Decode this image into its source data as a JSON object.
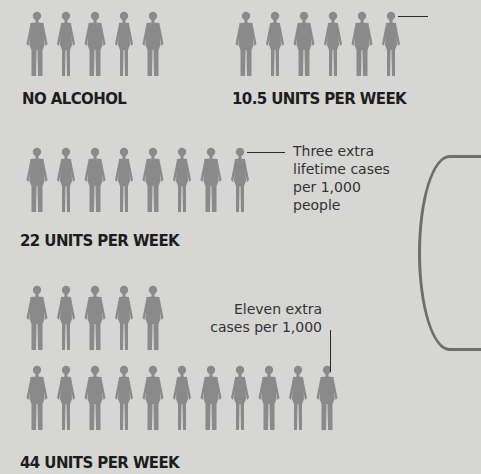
{
  "chart_data": {
    "type": "pictogram",
    "title": "",
    "unit": "people figures",
    "categories": [
      "NO ALCOHOL",
      "10.5 UNITS PER WEEK",
      "22 UNITS PER WEEK",
      "44 UNITS PER WEEK"
    ],
    "values": [
      5,
      6,
      8,
      16
    ],
    "annotations": [
      {
        "category": "22 UNITS PER WEEK",
        "text": "Three extra lifetime cases per 1,000 people"
      },
      {
        "category": "44 UNITS PER WEEK",
        "text": "Eleven extra cases per 1,000"
      }
    ],
    "figure_color": "#8a8a8a",
    "background_color": "#d6d6d4"
  },
  "groups": {
    "no_alcohol": {
      "label": "NO ALCOHOL",
      "count": 5
    },
    "units_10_5": {
      "label": "10.5 UNITS PER WEEK",
      "count": 6
    },
    "units_22": {
      "label": "22 UNITS PER WEEK",
      "count": 8,
      "note_lines": [
        "Three extra",
        "lifetime cases",
        "per 1,000",
        "people"
      ]
    },
    "units_44": {
      "label": "44 UNITS PER WEEK",
      "count": 16,
      "note_lines": [
        "Eleven extra",
        "cases per 1,000"
      ]
    }
  }
}
